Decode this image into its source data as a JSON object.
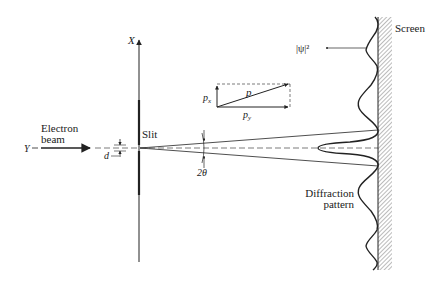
{
  "labels": {
    "x_axis": "X",
    "y_axis": "Y",
    "electron_line1": "Electron",
    "electron_line2": "beam",
    "slit": "Slit",
    "slit_width": "d",
    "angle": "2θ",
    "momentum": "p",
    "momentum_x": "p",
    "momentum_x_sub": "x",
    "momentum_y": "p",
    "momentum_y_sub": "y",
    "screen": "Screen",
    "psi_squared": "|ψ|²",
    "diffraction_line1": "Diffraction",
    "diffraction_line2": "pattern"
  },
  "colors": {
    "ink": "#222222",
    "background": "#ffffff",
    "hatch": "#777777"
  }
}
